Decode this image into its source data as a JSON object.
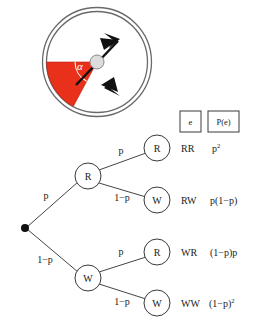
{
  "spinner": {
    "name": "spinner-wheel",
    "sector_color": "#e8301a",
    "outline_color": "#555555",
    "hub_color": "#d8d8d8",
    "needle_color": "#111111",
    "angle_label": "α",
    "sector_start_deg": 180,
    "sector_end_deg": 242,
    "center": {
      "x": 97,
      "y": 62
    },
    "radius": 54
  },
  "table_header": {
    "event_label": "e",
    "probability_label": "P(e)"
  },
  "tree": {
    "root": {
      "name": "root-node",
      "label": ""
    },
    "nodes": [
      {
        "id": "n-r1",
        "label": "R",
        "x": 88,
        "y": 176
      },
      {
        "id": "n-w1",
        "label": "W",
        "x": 88,
        "y": 278
      },
      {
        "id": "n-rr",
        "label": "R",
        "x": 157,
        "y": 148
      },
      {
        "id": "n-rw",
        "label": "W",
        "x": 157,
        "y": 200
      },
      {
        "id": "n-wr",
        "label": "R",
        "x": 157,
        "y": 252
      },
      {
        "id": "n-ww",
        "label": "W",
        "x": 157,
        "y": 303
      }
    ],
    "branch_labels": {
      "root_to_r": "p",
      "root_to_w": "1−p",
      "r_to_r": "p",
      "r_to_w": "1−p",
      "w_to_r": "p",
      "w_to_w": "1−p"
    },
    "outcomes": [
      {
        "event": "RR",
        "probability": "p",
        "probability_sup": "2",
        "probability_full": "p²",
        "y": 148
      },
      {
        "event": "RW",
        "probability": "p(1−p)",
        "probability_sup": "",
        "probability_full": "p(1−p)",
        "y": 200
      },
      {
        "event": "WR",
        "probability": "(1−p)p",
        "probability_sup": "",
        "probability_full": "(1−p)p",
        "y": 252
      },
      {
        "event": "WW",
        "probability": "(1−p)",
        "probability_sup": "2",
        "probability_full": "(1−p)²",
        "y": 303
      }
    ]
  }
}
